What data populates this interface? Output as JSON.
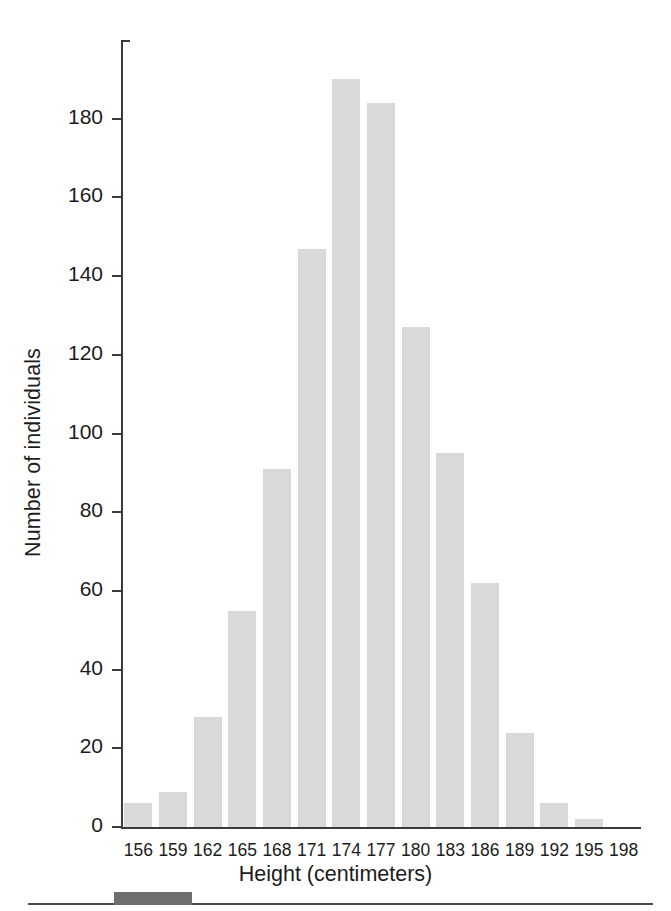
{
  "chart_data": {
    "type": "bar",
    "title": "",
    "subtitle": "",
    "xlabel": "Height (centimeters)",
    "ylabel": "Number of individuals",
    "categories": [
      "156",
      "159",
      "162",
      "165",
      "168",
      "171",
      "174",
      "177",
      "180",
      "183",
      "186",
      "189",
      "192",
      "195",
      "198"
    ],
    "values": [
      6,
      9,
      28,
      55,
      91,
      147,
      190,
      184,
      127,
      95,
      62,
      24,
      6,
      2,
      0
    ],
    "ylim": [
      0,
      200
    ],
    "yticks": [
      0,
      20,
      40,
      60,
      80,
      100,
      120,
      140,
      160,
      180
    ],
    "ytick_labels": [
      "0",
      "20",
      "40",
      "60",
      "80",
      "100",
      "120",
      "140",
      "160",
      "180"
    ],
    "grid": false,
    "legend": null,
    "bar_color": "#d9d9d9",
    "axis_color": "#3b3b3b",
    "annotations": []
  },
  "artifact": {
    "footer_rule": "horizontal-rule",
    "footer_block": "dark-block"
  }
}
